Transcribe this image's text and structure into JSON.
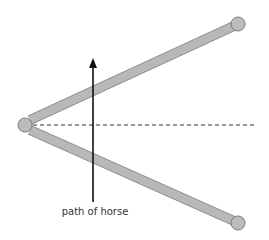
{
  "diagram": {
    "type": "mechanism",
    "label_path": "path of horse",
    "colors": {
      "rod_fill": "#b8b8b8",
      "rod_stroke": "#8a8a8a",
      "joint_fill": "#bcbcbc",
      "joint_stroke": "#7a7a7a",
      "arrow": "#111111",
      "dashed": "#333333",
      "background": "#ffffff"
    },
    "pivot": {
      "x": 25,
      "y": 125,
      "r": 7
    },
    "rods": [
      {
        "name": "upper-rod",
        "x1": 30,
        "y1": 120,
        "x2": 234,
        "y2": 26
      },
      {
        "name": "lower-rod",
        "x1": 30,
        "y1": 130,
        "x2": 234,
        "y2": 221
      }
    ],
    "end_joints": [
      {
        "name": "upper-end-joint",
        "x": 238,
        "y": 24,
        "r": 7
      },
      {
        "name": "lower-end-joint",
        "x": 238,
        "y": 223,
        "r": 7
      }
    ],
    "axis_line": {
      "x1": 33,
      "y1": 125,
      "x2": 255,
      "y2": 125
    },
    "arrow": {
      "x": 93,
      "y_start": 202,
      "y_end": 58
    },
    "label_position": {
      "x": 95,
      "y": 206
    }
  }
}
